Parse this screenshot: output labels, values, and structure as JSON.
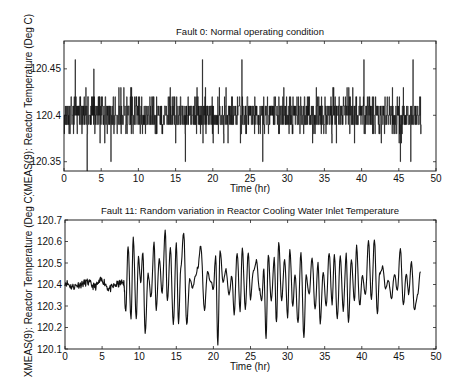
{
  "chart_data": [
    {
      "type": "line",
      "title": "Fault 0: Normal operating condition",
      "xlabel": "Time (hr)",
      "ylabel": "XMEAS(9): Reactor Temperature (Deg C)",
      "xlim": [
        0,
        50
      ],
      "ylim": [
        120.34,
        120.48
      ],
      "xticks": [
        0,
        5,
        10,
        15,
        20,
        25,
        30,
        35,
        40,
        45,
        50
      ],
      "yticks": [
        120.35,
        120.4,
        120.45
      ],
      "ytick_labels": [
        "120.35",
        "120.4",
        "120.45"
      ],
      "grid": false,
      "color": "#111111",
      "series": [
        {
          "name": "Reactor Temperature (Fault 0)",
          "description": "Quantized noisy signal (0.01 steps) around 120.40, range ~120.34 to 120.46, 0 to 48 hr",
          "x_range": [
            0,
            48
          ],
          "mean": 120.4,
          "peaks": [
            {
              "x": 1.5,
              "y": 120.46
            },
            {
              "x": 4.0,
              "y": 120.45
            },
            {
              "x": 18.6,
              "y": 120.46
            },
            {
              "x": 23.9,
              "y": 120.46
            },
            {
              "x": 40.3,
              "y": 120.46
            },
            {
              "x": 46.9,
              "y": 120.46
            }
          ],
          "troughs": [
            {
              "x": 3.1,
              "y": 120.34
            },
            {
              "x": 6.3,
              "y": 120.35
            },
            {
              "x": 16.3,
              "y": 120.35
            },
            {
              "x": 26.7,
              "y": 120.35
            },
            {
              "x": 45.2,
              "y": 120.35
            },
            {
              "x": 46.6,
              "y": 120.35
            }
          ]
        }
      ]
    },
    {
      "type": "line",
      "title": "Fault 11: Random variation in Reactor Cooling Water Inlet Temperature",
      "xlabel": "Time (hr)",
      "ylabel": "XMEAS(9): Reactor Temperature (Deg C)",
      "xlim": [
        0,
        50
      ],
      "ylim": [
        120.1,
        120.7
      ],
      "xticks": [
        0,
        5,
        10,
        15,
        20,
        25,
        30,
        35,
        40,
        45,
        50
      ],
      "yticks": [
        120.1,
        120.2,
        120.3,
        120.4,
        120.5,
        120.6,
        120.7
      ],
      "ytick_labels": [
        "120.1",
        "120.2",
        "120.3",
        "120.4",
        "120.5",
        "120.6",
        "120.7"
      ],
      "grid": false,
      "color": "#111111",
      "fault_onset_hr": 8,
      "series": [
        {
          "name": "Reactor Temperature (Fault 11)",
          "x": [
            0,
            1,
            2,
            3,
            4,
            5,
            6,
            7,
            7.9,
            8.2,
            8.5,
            8.9,
            9.2,
            9.6,
            9.9,
            10.2,
            10.5,
            10.8,
            11.2,
            11.6,
            12.0,
            12.3,
            12.7,
            13.1,
            13.5,
            13.8,
            14.2,
            14.6,
            15.0,
            15.3,
            15.6,
            16.0,
            16.4,
            16.8,
            17.2,
            17.6,
            17.9,
            18.3,
            18.8,
            19.2,
            19.6,
            20.0,
            20.3,
            20.6,
            20.9,
            21.3,
            21.7,
            22.1,
            22.5,
            22.8,
            23.2,
            23.6,
            23.9,
            24.3,
            24.7,
            25.0,
            25.4,
            25.8,
            26.2,
            26.5,
            26.8,
            27.1,
            27.4,
            27.8,
            28.2,
            28.5,
            28.8,
            29.2,
            29.6,
            30.0,
            30.3,
            30.7,
            31.0,
            31.4,
            31.8,
            32.2,
            32.5,
            32.9,
            33.3,
            33.7,
            34.1,
            34.4,
            34.8,
            35.2,
            35.6,
            36.0,
            36.3,
            36.7,
            37.1,
            37.5,
            37.9,
            38.2,
            38.6,
            39.0,
            39.3,
            39.7,
            40.1,
            40.5,
            40.9,
            41.3,
            41.7,
            42.1,
            42.4,
            42.8,
            43.2,
            43.6,
            44.0,
            44.4,
            44.8,
            45.2,
            45.6,
            46.0,
            46.3,
            46.7,
            47.1,
            47.5,
            47.9
          ],
          "y": [
            120.41,
            120.39,
            120.4,
            120.41,
            120.39,
            120.42,
            120.38,
            120.4,
            120.41,
            120.28,
            120.58,
            120.24,
            120.62,
            120.24,
            120.53,
            120.41,
            120.55,
            120.17,
            120.45,
            120.34,
            120.59,
            120.28,
            120.52,
            120.36,
            120.65,
            120.32,
            120.57,
            120.21,
            120.59,
            120.22,
            120.47,
            120.64,
            120.21,
            120.42,
            120.39,
            120.44,
            120.48,
            120.58,
            120.28,
            120.46,
            120.42,
            120.38,
            120.53,
            120.12,
            120.56,
            120.41,
            120.47,
            120.35,
            120.44,
            120.26,
            120.55,
            120.28,
            120.57,
            120.29,
            120.55,
            120.33,
            120.47,
            120.51,
            120.38,
            120.32,
            120.47,
            120.15,
            120.54,
            120.32,
            120.52,
            120.22,
            120.6,
            120.32,
            120.52,
            120.25,
            120.56,
            120.3,
            120.45,
            120.22,
            120.55,
            120.15,
            120.44,
            120.35,
            120.53,
            120.28,
            120.5,
            120.22,
            120.46,
            120.3,
            120.55,
            120.31,
            120.54,
            120.24,
            120.53,
            120.28,
            120.54,
            120.22,
            120.52,
            120.32,
            120.58,
            120.3,
            120.44,
            120.35,
            120.6,
            120.33,
            120.61,
            120.26,
            120.45,
            120.48,
            120.38,
            120.42,
            120.33,
            120.45,
            120.37,
            120.57,
            120.3,
            120.45,
            120.36,
            120.5,
            120.28,
            120.35,
            120.46
          ]
        }
      ]
    }
  ]
}
